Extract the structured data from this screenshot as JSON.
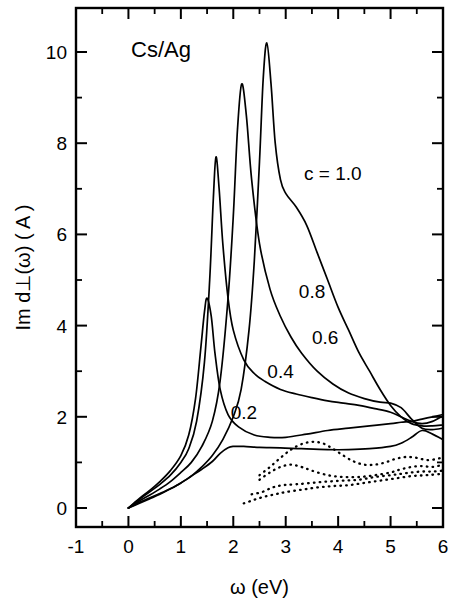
{
  "figure": {
    "system_label": "Cs/Ag",
    "x_axis": {
      "title": "ω  (eV)",
      "ticks": [
        "-1",
        "0",
        "1",
        "2",
        "3",
        "4",
        "5",
        "6"
      ],
      "min": -1,
      "max": 6
    },
    "y_axis": {
      "title": "Im d⊥(ω) ( A )",
      "ticks": [
        "0",
        "2",
        "4",
        "6",
        "8",
        "10"
      ],
      "min": -2,
      "max": 11
    },
    "series_labels": [
      "c = 1.0",
      "0.8",
      "0.6",
      "0.4",
      "0.2"
    ]
  },
  "chart_data": {
    "type": "line",
    "title": "Cs/Ag",
    "xlabel": "ω  (eV)",
    "ylabel": "Im d⊥(ω) ( A )",
    "xlim": [
      -1,
      6
    ],
    "ylim": [
      -2,
      11
    ],
    "grid": false,
    "legend": "inline-curve-labels",
    "xticks": [
      -1,
      0,
      1,
      2,
      3,
      4,
      5,
      6
    ],
    "yticks": [
      0,
      2,
      4,
      6,
      8,
      10
    ],
    "annotations": [
      {
        "text": "Cs/Ag",
        "x": 0.05,
        "y": 9.9
      },
      {
        "text": "c = 1.0",
        "x": 3.35,
        "y": 7.2
      },
      {
        "text": "0.8",
        "x": 3.25,
        "y": 4.6
      },
      {
        "text": "0.6",
        "x": 3.5,
        "y": 3.6
      },
      {
        "text": "0.4",
        "x": 2.65,
        "y": 2.85
      },
      {
        "text": "0.2",
        "x": 1.95,
        "y": 1.95
      }
    ],
    "series": [
      {
        "name": "c = 1.0",
        "style": "solid",
        "peak": {
          "x": 2.64,
          "y": 10.2
        },
        "x": [
          0.0,
          0.2,
          0.4,
          0.6,
          0.8,
          1.0,
          1.2,
          1.4,
          1.6,
          1.8,
          2.0,
          2.15,
          2.3,
          2.4,
          2.5,
          2.57,
          2.64,
          2.72,
          2.8,
          2.9,
          3.0,
          3.2,
          3.4,
          3.6,
          3.8,
          4.0,
          4.2,
          4.4,
          4.6,
          4.8,
          5.0,
          5.2,
          5.4,
          5.6,
          5.8,
          6.0
        ],
        "y": [
          0.0,
          0.12,
          0.22,
          0.32,
          0.42,
          0.55,
          0.7,
          0.9,
          1.15,
          1.5,
          2.0,
          2.6,
          3.9,
          5.4,
          7.6,
          9.4,
          10.2,
          9.3,
          8.0,
          7.2,
          6.9,
          6.6,
          6.2,
          5.6,
          5.0,
          4.4,
          3.9,
          3.4,
          3.0,
          2.6,
          2.25,
          2.0,
          1.85,
          1.8,
          1.8,
          1.82
        ]
      },
      {
        "name": "0.8",
        "style": "solid",
        "peak": {
          "x": 2.16,
          "y": 9.3
        },
        "x": [
          0.0,
          0.2,
          0.4,
          0.6,
          0.8,
          1.0,
          1.2,
          1.4,
          1.6,
          1.75,
          1.9,
          2.0,
          2.08,
          2.16,
          2.25,
          2.35,
          2.5,
          2.7,
          2.9,
          3.1,
          3.3,
          3.6,
          3.9,
          4.2,
          4.5,
          4.8,
          5.0,
          5.2,
          5.4,
          5.6,
          5.8,
          6.0
        ],
        "y": [
          0.0,
          0.15,
          0.28,
          0.42,
          0.58,
          0.78,
          1.0,
          1.35,
          1.9,
          2.8,
          4.6,
          6.4,
          8.3,
          9.3,
          8.6,
          7.2,
          5.8,
          4.8,
          4.2,
          3.75,
          3.4,
          3.0,
          2.72,
          2.52,
          2.4,
          2.32,
          2.3,
          2.2,
          1.95,
          1.75,
          1.72,
          1.75
        ]
      },
      {
        "name": "0.6",
        "style": "solid",
        "peak": {
          "x": 1.67,
          "y": 7.7
        },
        "x": [
          0.0,
          0.2,
          0.4,
          0.6,
          0.8,
          1.0,
          1.15,
          1.3,
          1.45,
          1.55,
          1.62,
          1.67,
          1.73,
          1.8,
          1.9,
          2.0,
          2.2,
          2.4,
          2.6,
          2.9,
          3.2,
          3.5,
          3.8,
          4.1,
          4.4,
          4.7,
          5.0,
          5.2,
          5.4,
          5.6,
          5.8,
          6.0
        ],
        "y": [
          0.0,
          0.18,
          0.35,
          0.52,
          0.72,
          1.0,
          1.3,
          1.9,
          3.2,
          5.0,
          6.8,
          7.7,
          7.0,
          5.8,
          4.6,
          3.9,
          3.25,
          2.95,
          2.78,
          2.6,
          2.5,
          2.42,
          2.35,
          2.3,
          2.25,
          2.18,
          2.1,
          2.0,
          1.9,
          1.85,
          1.9,
          2.02
        ]
      },
      {
        "name": "0.4",
        "style": "solid",
        "peak": {
          "x": 1.48,
          "y": 4.6
        },
        "x": [
          0.0,
          0.2,
          0.4,
          0.6,
          0.8,
          1.0,
          1.15,
          1.28,
          1.38,
          1.45,
          1.5,
          1.58,
          1.65,
          1.75,
          1.9,
          2.1,
          2.4,
          2.7,
          3.0,
          3.4,
          3.8,
          4.2,
          4.6,
          5.0,
          5.2,
          5.4,
          5.6,
          5.8,
          6.0
        ],
        "y": [
          0.0,
          0.2,
          0.38,
          0.58,
          0.82,
          1.15,
          1.6,
          2.4,
          3.5,
          4.3,
          4.6,
          4.2,
          3.4,
          2.6,
          2.05,
          1.78,
          1.6,
          1.55,
          1.55,
          1.62,
          1.7,
          1.75,
          1.8,
          1.85,
          1.88,
          1.9,
          1.95,
          2.0,
          2.05
        ]
      },
      {
        "name": "0.2",
        "style": "solid",
        "peak": {
          "x": 2.0,
          "y": 1.35
        },
        "x": [
          0.0,
          0.2,
          0.4,
          0.6,
          0.8,
          1.0,
          1.2,
          1.4,
          1.6,
          1.75,
          1.9,
          2.0,
          2.2,
          2.5,
          2.9,
          3.3,
          3.8,
          4.2,
          4.6,
          5.0,
          5.2,
          5.4,
          5.6,
          5.8,
          6.0
        ],
        "y": [
          0.0,
          0.1,
          0.2,
          0.3,
          0.42,
          0.55,
          0.7,
          0.85,
          1.02,
          1.2,
          1.32,
          1.35,
          1.35,
          1.33,
          1.32,
          1.3,
          1.28,
          1.28,
          1.3,
          1.35,
          1.42,
          1.55,
          1.7,
          1.62,
          1.5
        ]
      },
      {
        "name": "dotted-a",
        "style": "dotted",
        "x": [
          2.5,
          2.7,
          2.9,
          3.1,
          3.3,
          3.5,
          3.7,
          3.9,
          4.1,
          4.3,
          4.5,
          4.7,
          4.9,
          5.1,
          5.3,
          5.5,
          5.7,
          5.9,
          6.0
        ],
        "y": [
          0.72,
          0.9,
          1.1,
          1.28,
          1.4,
          1.45,
          1.42,
          1.3,
          1.15,
          1.02,
          0.95,
          0.95,
          1.0,
          1.08,
          1.12,
          1.1,
          1.05,
          1.08,
          1.12
        ]
      },
      {
        "name": "dotted-b",
        "style": "dotted",
        "x": [
          2.5,
          2.7,
          2.9,
          3.1,
          3.3,
          3.5,
          3.8,
          4.1,
          4.4,
          4.7,
          5.0,
          5.2,
          5.4,
          5.6,
          5.8,
          6.0
        ],
        "y": [
          0.62,
          0.78,
          0.9,
          0.95,
          0.9,
          0.82,
          0.72,
          0.68,
          0.68,
          0.72,
          0.78,
          0.85,
          0.9,
          0.92,
          0.9,
          0.95
        ]
      },
      {
        "name": "dotted-c",
        "style": "dotted",
        "x": [
          2.35,
          2.55,
          2.75,
          2.95,
          3.2,
          3.5,
          3.8,
          4.1,
          4.4,
          4.7,
          5.0,
          5.2,
          5.4,
          5.6,
          5.8,
          6.0
        ],
        "y": [
          0.3,
          0.35,
          0.45,
          0.5,
          0.52,
          0.55,
          0.58,
          0.6,
          0.62,
          0.68,
          0.72,
          0.75,
          0.78,
          0.8,
          0.8,
          0.82
        ]
      },
      {
        "name": "dotted-d",
        "style": "dotted",
        "x": [
          2.2,
          2.4,
          2.6,
          2.8,
          3.0,
          3.3,
          3.6,
          3.9,
          4.2,
          4.5,
          4.8,
          5.1,
          5.4,
          5.7,
          6.0
        ],
        "y": [
          0.1,
          0.18,
          0.25,
          0.3,
          0.35,
          0.4,
          0.45,
          0.48,
          0.5,
          0.55,
          0.6,
          0.65,
          0.7,
          0.72,
          0.75
        ]
      }
    ]
  }
}
